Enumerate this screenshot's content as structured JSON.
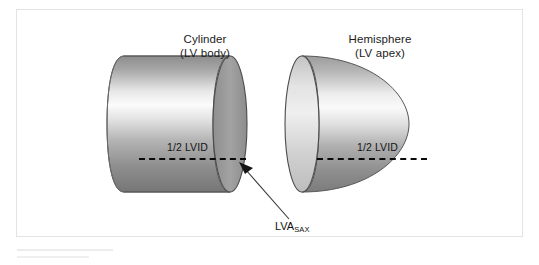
{
  "figure": {
    "panel_background": "#ffffff",
    "frame_color": "#e3e3e3",
    "shapes": [
      {
        "id": "cylinder",
        "name": "Cylinder",
        "title": "Cylinder",
        "subtitle": "(LV body)",
        "dimension_label": "1/2 LVID",
        "body_gradient": [
          "#8d8d8d",
          "#fbfbfb",
          "#9a9a9a",
          "#767676"
        ],
        "face_fill": "#9b9b9b",
        "outline_color": "#4a4a4a"
      },
      {
        "id": "hemisphere",
        "name": "Hemisphere",
        "title": "Hemisphere",
        "subtitle": "(LV apex)",
        "dimension_label": "1/2 LVID",
        "body_gradient": [
          "#9c9c9c",
          "#fafafa",
          "#a0a0a0",
          "#7c7c7c"
        ],
        "face_fill": "#d8d8d8",
        "outline_color": "#4a4a4a"
      }
    ],
    "annotation": {
      "label_main": "LVA",
      "label_subscript": "SAX",
      "arrow_color": "#3a3a3a",
      "points_to": "cylinder-front-face"
    },
    "dashed_line_color": "#0a0a0a"
  }
}
